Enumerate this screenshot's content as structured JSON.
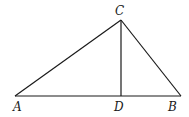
{
  "diagram": {
    "type": "geometry-triangle",
    "points": {
      "A": {
        "x": 15,
        "y": 96
      },
      "B": {
        "x": 181,
        "y": 96
      },
      "C": {
        "x": 121,
        "y": 20
      },
      "D": {
        "x": 121,
        "y": 96
      }
    },
    "segments": [
      [
        "A",
        "C"
      ],
      [
        "C",
        "B"
      ],
      [
        "A",
        "B"
      ],
      [
        "C",
        "D"
      ]
    ],
    "labels": {
      "A": "A",
      "B": "B",
      "C": "C",
      "D": "D"
    },
    "stroke_color": "#1a1a1a"
  }
}
